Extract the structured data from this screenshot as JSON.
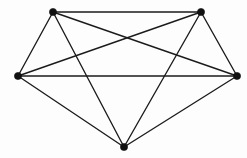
{
  "diagram": {
    "type": "graph-drawing",
    "background_color": "#fdfdfd",
    "edge_color": "#1b1b1b",
    "vertex_color": "#111111",
    "edge_width": 1.35,
    "vertex_radius": 3.6,
    "vertex_count": 5,
    "edge_count": 10,
    "canvas": {
      "width": 247,
      "height": 158
    }
  },
  "chart_data": {
    "type": "diagram",
    "xlabel": "",
    "ylabel": "",
    "nodes": [
      {
        "id": "v1",
        "label": "",
        "name": "top-left",
        "x": 53,
        "y": 12
      },
      {
        "id": "v2",
        "label": "",
        "name": "top-right",
        "x": 201,
        "y": 12
      },
      {
        "id": "v3",
        "label": "",
        "name": "left",
        "x": 18,
        "y": 76
      },
      {
        "id": "v4",
        "label": "",
        "name": "right",
        "x": 237,
        "y": 76
      },
      {
        "id": "v5",
        "label": "",
        "name": "bottom",
        "x": 124,
        "y": 147
      }
    ],
    "edges": [
      {
        "source": "v1",
        "target": "v2"
      },
      {
        "source": "v1",
        "target": "v3"
      },
      {
        "source": "v1",
        "target": "v4"
      },
      {
        "source": "v1",
        "target": "v5"
      },
      {
        "source": "v2",
        "target": "v3"
      },
      {
        "source": "v2",
        "target": "v4"
      },
      {
        "source": "v2",
        "target": "v5"
      },
      {
        "source": "v3",
        "target": "v4"
      },
      {
        "source": "v3",
        "target": "v5"
      },
      {
        "source": "v4",
        "target": "v5"
      }
    ]
  }
}
